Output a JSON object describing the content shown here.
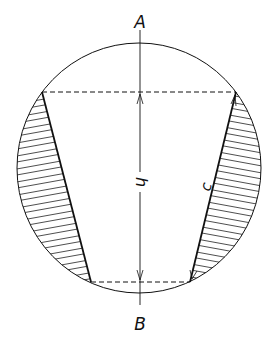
{
  "diagram": {
    "labels": {
      "top_point": "A",
      "bottom_point": "B",
      "height": "h",
      "slant": "c"
    },
    "caption": "Fig. — Sphere cut by a frustum of a cone (caption illegible)",
    "colors": {
      "stroke": "#111111",
      "background": "#ffffff"
    }
  }
}
